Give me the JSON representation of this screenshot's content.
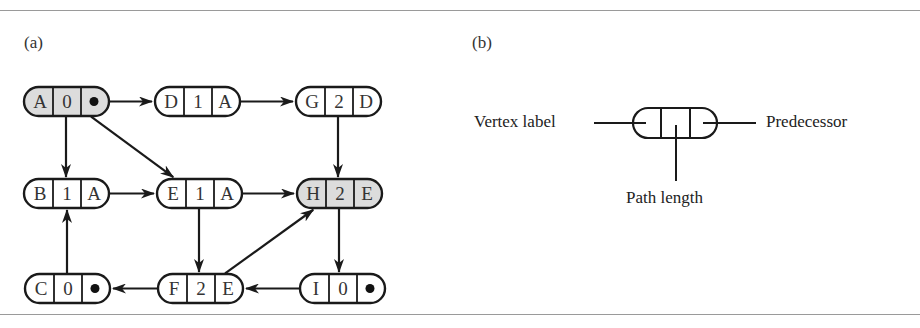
{
  "panels": {
    "a": {
      "label": "(a)"
    },
    "b": {
      "label": "(b)"
    }
  },
  "colors": {
    "highlight_fill": "#dcdcdc",
    "stroke": "#1a1a1a",
    "rule": "#9a9a9a"
  },
  "graph": {
    "nodes": [
      {
        "id": "A",
        "vertex": "A",
        "path_length": "0",
        "predecessor": "•",
        "highlighted": true,
        "x": 24,
        "y": 87
      },
      {
        "id": "D",
        "vertex": "D",
        "path_length": "1",
        "predecessor": "A",
        "highlighted": false,
        "x": 155,
        "y": 87
      },
      {
        "id": "G",
        "vertex": "G",
        "path_length": "2",
        "predecessor": "D",
        "highlighted": false,
        "x": 296,
        "y": 87
      },
      {
        "id": "B",
        "vertex": "B",
        "path_length": "1",
        "predecessor": "A",
        "highlighted": false,
        "x": 24,
        "y": 179
      },
      {
        "id": "E",
        "vertex": "E",
        "path_length": "1",
        "predecessor": "A",
        "highlighted": false,
        "x": 157,
        "y": 179
      },
      {
        "id": "H",
        "vertex": "H",
        "path_length": "2",
        "predecessor": "E",
        "highlighted": true,
        "x": 297,
        "y": 179
      },
      {
        "id": "C",
        "vertex": "C",
        "path_length": "0",
        "predecessor": "•",
        "highlighted": false,
        "x": 25,
        "y": 274
      },
      {
        "id": "F",
        "vertex": "F",
        "path_length": "2",
        "predecessor": "E",
        "highlighted": false,
        "x": 158,
        "y": 274
      },
      {
        "id": "I",
        "vertex": "I",
        "path_length": "0",
        "predecessor": "•",
        "highlighted": false,
        "x": 300,
        "y": 274
      }
    ],
    "edges": [
      {
        "from": "A",
        "to": "D"
      },
      {
        "from": "D",
        "to": "G"
      },
      {
        "from": "A",
        "to": "B"
      },
      {
        "from": "A",
        "to": "E"
      },
      {
        "from": "G",
        "to": "H"
      },
      {
        "from": "B",
        "to": "E"
      },
      {
        "from": "E",
        "to": "H"
      },
      {
        "from": "E",
        "to": "F"
      },
      {
        "from": "F",
        "to": "H"
      },
      {
        "from": "H",
        "to": "I"
      },
      {
        "from": "I",
        "to": "F"
      },
      {
        "from": "F",
        "to": "C"
      },
      {
        "from": "C",
        "to": "B"
      }
    ]
  },
  "legend": {
    "vertex_label": "Vertex label",
    "predecessor": "Predecessor",
    "path_length": "Path length"
  }
}
